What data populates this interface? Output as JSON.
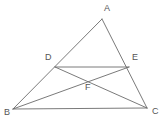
{
  "figure": {
    "type": "geometry-diagram",
    "canvas": {
      "width": 167,
      "height": 123
    },
    "background_color": "#ffffff",
    "line_color": "#6b6b6b",
    "label_color": "#555555",
    "line_width": 0.9,
    "points": [
      {
        "id": "A",
        "label": "A",
        "x": 102,
        "y": 19,
        "label_x": 104,
        "label_y": 4
      },
      {
        "id": "B",
        "label": "B",
        "x": 13,
        "y": 109,
        "label_x": 4,
        "label_y": 108
      },
      {
        "id": "C",
        "label": "C",
        "x": 147,
        "y": 108,
        "label_x": 152,
        "label_y": 107
      },
      {
        "id": "D",
        "label": "D",
        "x": 55,
        "y": 67,
        "label_x": 45,
        "label_y": 53
      },
      {
        "id": "E",
        "label": "E",
        "x": 129,
        "y": 67,
        "label_x": 132,
        "label_y": 53
      },
      {
        "id": "F",
        "label": "F",
        "x": 88,
        "y": 79,
        "label_x": 85,
        "label_y": 83
      }
    ],
    "segments": [
      {
        "id": "AB",
        "from": "A",
        "to": "B",
        "name": "side-ab"
      },
      {
        "id": "AC",
        "from": "A",
        "to": "C",
        "name": "side-ac"
      },
      {
        "id": "BC",
        "from": "B",
        "to": "C",
        "name": "side-bc"
      },
      {
        "id": "DE",
        "from": "D",
        "to": "E",
        "name": "segment-de"
      },
      {
        "id": "BE",
        "from": "B",
        "to": "E",
        "name": "cevian-be"
      },
      {
        "id": "DC",
        "from": "D",
        "to": "C",
        "name": "cevian-dc"
      }
    ]
  }
}
